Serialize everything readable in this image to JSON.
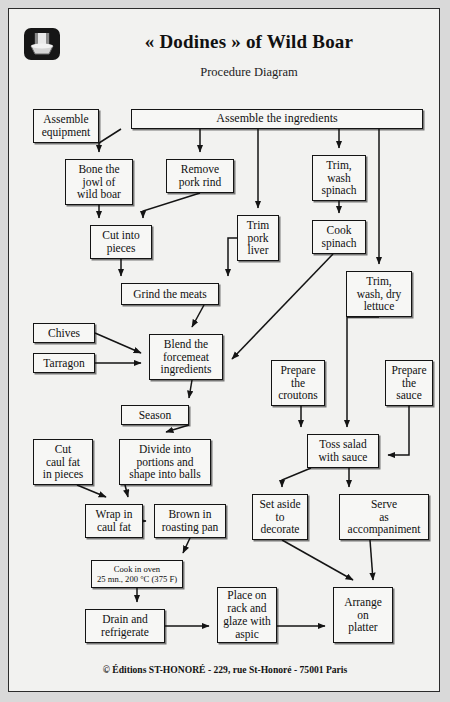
{
  "document": {
    "title": "« Dodines » of Wild Boar",
    "subtitle": "Procedure Diagram",
    "logo_icon": "chef-toque-logo-icon",
    "footer": "© Éditions ST-HONORÉ - 229, rue St-Honoré - 75001 Paris",
    "page_background": "#f2f2f0",
    "border_color": "#141414"
  },
  "chart_data": {
    "type": "diagram",
    "title": "« Dodines » of Wild Boar",
    "subtitle": "Procedure Diagram",
    "nodes": [
      {
        "id": "assemble_equipment",
        "label": "Assemble\nequipment",
        "x": 24,
        "y": 100,
        "w": 66,
        "h": 34
      },
      {
        "id": "assemble_ingredients",
        "label": "Assemble the ingredients",
        "x": 122,
        "y": 100,
        "w": 292,
        "h": 20
      },
      {
        "id": "bone_jowl",
        "label": "Bone the\njowl of\nwild boar",
        "x": 56,
        "y": 150,
        "w": 68,
        "h": 46
      },
      {
        "id": "remove_pork_rind",
        "label": "Remove\npork rind",
        "x": 157,
        "y": 150,
        "w": 68,
        "h": 34
      },
      {
        "id": "trim_wash_spinach",
        "label": "Trim,\nwash\nspinach",
        "x": 303,
        "y": 146,
        "w": 54,
        "h": 46
      },
      {
        "id": "cut_into_pieces",
        "label": "Cut into\npieces",
        "x": 81,
        "y": 216,
        "w": 62,
        "h": 34
      },
      {
        "id": "trim_pork_liver",
        "label": "Trim\npork\nliver",
        "x": 228,
        "y": 206,
        "w": 42,
        "h": 46
      },
      {
        "id": "cook_spinach",
        "label": "Cook\nspinach",
        "x": 303,
        "y": 211,
        "w": 54,
        "h": 34
      },
      {
        "id": "grind_meats",
        "label": "Grind the meats",
        "x": 112,
        "y": 274,
        "w": 98,
        "h": 22
      },
      {
        "id": "trim_wash_dry_lettuce",
        "label": "Trim,\nwash, dry\nlettuce",
        "x": 337,
        "y": 262,
        "w": 66,
        "h": 46
      },
      {
        "id": "chives",
        "label": "Chives",
        "x": 24,
        "y": 314,
        "w": 62,
        "h": 20
      },
      {
        "id": "tarragon",
        "label": "Tarragon",
        "x": 24,
        "y": 344,
        "w": 62,
        "h": 20
      },
      {
        "id": "blend_forcemeat",
        "label": "Blend the\nforcemeat\ningredients",
        "x": 140,
        "y": 325,
        "w": 74,
        "h": 46
      },
      {
        "id": "prepare_croutons",
        "label": "Prepare\nthe\ncroutons",
        "x": 262,
        "y": 351,
        "w": 54,
        "h": 46
      },
      {
        "id": "prepare_sauce",
        "label": "Prepare\nthe\nsauce",
        "x": 376,
        "y": 351,
        "w": 48,
        "h": 46
      },
      {
        "id": "season",
        "label": "Season",
        "x": 112,
        "y": 396,
        "w": 68,
        "h": 20
      },
      {
        "id": "cut_caul_fat",
        "label": "Cut\ncaul fat\nin pieces",
        "x": 24,
        "y": 430,
        "w": 60,
        "h": 46
      },
      {
        "id": "divide_portions",
        "label": "Divide into\nportions and\nshape into balls",
        "x": 110,
        "y": 430,
        "w": 92,
        "h": 46
      },
      {
        "id": "toss_salad",
        "label": "Toss salad\nwith sauce",
        "x": 298,
        "y": 425,
        "w": 72,
        "h": 34
      },
      {
        "id": "wrap_caul_fat",
        "label": "Wrap in\ncaul fat",
        "x": 76,
        "y": 495,
        "w": 58,
        "h": 34
      },
      {
        "id": "brown_roasting_pan",
        "label": "Brown in\nroasting pan",
        "x": 145,
        "y": 495,
        "w": 72,
        "h": 34
      },
      {
        "id": "set_aside_decorate",
        "label": "Set aside\nto\ndecorate",
        "x": 243,
        "y": 485,
        "w": 56,
        "h": 46
      },
      {
        "id": "serve_accompaniment",
        "label": "Serve\nas\naccompaniment",
        "x": 330,
        "y": 485,
        "w": 90,
        "h": 46
      },
      {
        "id": "cook_in_oven",
        "label": "Cook in oven\n25 mn., 200 °C (375 F)",
        "x": 82,
        "y": 551,
        "w": 92,
        "h": 28
      },
      {
        "id": "place_on_rack",
        "label": "Place on\nrack and\nglaze with\naspic",
        "x": 208,
        "y": 578,
        "w": 60,
        "h": 56
      },
      {
        "id": "drain_refrigerate",
        "label": "Drain and\nrefrigerate",
        "x": 76,
        "y": 600,
        "w": 80,
        "h": 34
      },
      {
        "id": "arrange_on_platter",
        "label": "Arrange\non\nplatter",
        "x": 324,
        "y": 578,
        "w": 60,
        "h": 56
      }
    ],
    "edges": [
      {
        "from": "assemble_ingredients",
        "to": "bone_jowl"
      },
      {
        "from": "assemble_ingredients",
        "to": "remove_pork_rind"
      },
      {
        "from": "assemble_ingredients",
        "to": "trim_pork_liver"
      },
      {
        "from": "assemble_ingredients",
        "to": "trim_wash_spinach"
      },
      {
        "from": "assemble_ingredients",
        "to": "trim_wash_dry_lettuce"
      },
      {
        "from": "bone_jowl",
        "to": "cut_into_pieces"
      },
      {
        "from": "remove_pork_rind",
        "to": "cut_into_pieces"
      },
      {
        "from": "cut_into_pieces",
        "to": "grind_meats"
      },
      {
        "from": "trim_pork_liver",
        "to": "grind_meats"
      },
      {
        "from": "trim_wash_spinach",
        "to": "cook_spinach"
      },
      {
        "from": "cook_spinach",
        "to": "blend_forcemeat"
      },
      {
        "from": "grind_meats",
        "to": "blend_forcemeat"
      },
      {
        "from": "chives",
        "to": "blend_forcemeat"
      },
      {
        "from": "tarragon",
        "to": "blend_forcemeat"
      },
      {
        "from": "blend_forcemeat",
        "to": "season"
      },
      {
        "from": "season",
        "to": "divide_portions"
      },
      {
        "from": "cut_caul_fat",
        "to": "wrap_caul_fat"
      },
      {
        "from": "divide_portions",
        "to": "wrap_caul_fat"
      },
      {
        "from": "wrap_caul_fat",
        "to": "brown_roasting_pan"
      },
      {
        "from": "brown_roasting_pan",
        "to": "cook_in_oven"
      },
      {
        "from": "cook_in_oven",
        "to": "drain_refrigerate"
      },
      {
        "from": "drain_refrigerate",
        "to": "place_on_rack"
      },
      {
        "from": "place_on_rack",
        "to": "arrange_on_platter"
      },
      {
        "from": "trim_wash_dry_lettuce",
        "to": "toss_salad"
      },
      {
        "from": "prepare_croutons",
        "to": "toss_salad"
      },
      {
        "from": "prepare_sauce",
        "to": "toss_salad"
      },
      {
        "from": "toss_salad",
        "to": "set_aside_decorate"
      },
      {
        "from": "toss_salad",
        "to": "serve_accompaniment"
      },
      {
        "from": "set_aside_decorate",
        "to": "arrange_on_platter"
      },
      {
        "from": "serve_accompaniment",
        "to": "arrange_on_platter"
      }
    ]
  }
}
